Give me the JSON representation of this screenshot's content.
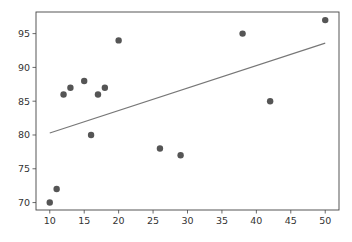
{
  "chart_data": {
    "type": "scatter",
    "title": "",
    "xlabel": "",
    "ylabel": "",
    "xlim": [
      8,
      52
    ],
    "ylim": [
      68.9,
      98.2
    ],
    "grid": false,
    "legend": null,
    "x_ticks": [
      10,
      15,
      20,
      25,
      30,
      35,
      40,
      45,
      50
    ],
    "y_ticks": [
      70,
      75,
      80,
      85,
      90,
      95
    ],
    "series": [
      {
        "name": "data",
        "kind": "scatter",
        "color": "#555555",
        "x": [
          10,
          11,
          12,
          13,
          15,
          16,
          17,
          18,
          20,
          26,
          29,
          38,
          42,
          50
        ],
        "y": [
          70,
          72,
          86,
          87,
          88,
          80,
          86,
          87,
          94,
          78,
          77,
          95,
          85,
          97
        ]
      },
      {
        "name": "fit",
        "kind": "line",
        "color": "#777777",
        "x": [
          10,
          50
        ],
        "y": [
          80.3,
          93.6
        ]
      }
    ]
  },
  "colors": {
    "axes": "#444444",
    "marker": "#555555",
    "line": "#777777"
  }
}
